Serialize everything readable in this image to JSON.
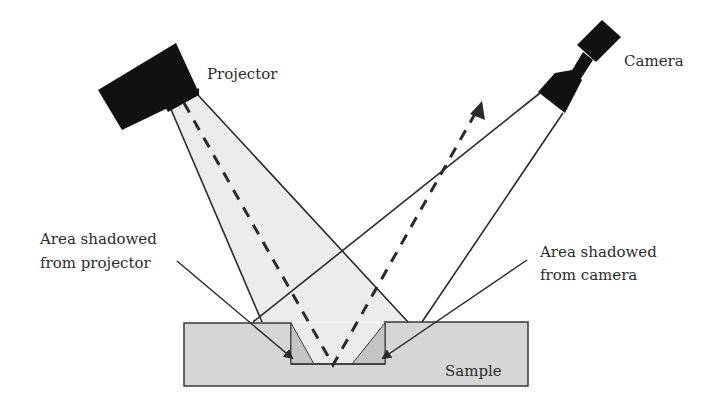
{
  "labels": {
    "projector": "Projector",
    "camera": "Camera",
    "shadow_projector_line1": "Area shadowed",
    "shadow_projector_line2": "from projector",
    "shadow_camera_line1": "Area shadowed",
    "shadow_camera_line2": "from camera",
    "sample": "Sample"
  },
  "colors": {
    "device_fill": "#111111",
    "beam_fill": "#ececec",
    "sample_fill": "#d6d6d6",
    "shadow_fill": "#c4c4c4",
    "line": "#2a2a2a"
  }
}
